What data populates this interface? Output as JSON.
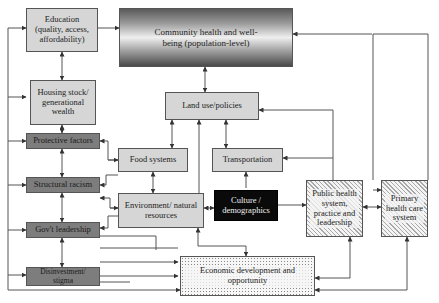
{
  "diagram": {
    "nodes": [
      {
        "id": "education",
        "label": "Education (quality, access, affordability)",
        "style": "light"
      },
      {
        "id": "community",
        "label": "Community health and well-being (population-level)",
        "style": "gradient"
      },
      {
        "id": "housing",
        "label": "Housing stock/ generational wealth",
        "style": "light"
      },
      {
        "id": "protective",
        "label": "Protective factors",
        "style": "dark"
      },
      {
        "id": "racism",
        "label": "Structural racism",
        "style": "dark"
      },
      {
        "id": "govt",
        "label": "Gov't leadership",
        "style": "dark"
      },
      {
        "id": "disinvestment",
        "label": "Disinvestment/ stigma",
        "style": "dark"
      },
      {
        "id": "landuse",
        "label": "Land use/policies",
        "style": "light"
      },
      {
        "id": "food",
        "label": "Food systems",
        "style": "light"
      },
      {
        "id": "transport",
        "label": "Transportation",
        "style": "light"
      },
      {
        "id": "environment",
        "label": "Environment/ natural resources",
        "style": "light"
      },
      {
        "id": "culture",
        "label": "Culture / demographics",
        "style": "black"
      },
      {
        "id": "publichealth",
        "label": "Public health system, practice and leadership",
        "style": "hatched"
      },
      {
        "id": "primarycare",
        "label": "Primary health care system",
        "style": "hatched"
      },
      {
        "id": "economic",
        "label": "Economic development and opportunity",
        "style": "dotted"
      }
    ],
    "colors": {
      "light_box": "#d6d6d6",
      "dark_box": "#7d7d7d",
      "black_box": "#0a0a0a",
      "line": "#444444"
    }
  }
}
